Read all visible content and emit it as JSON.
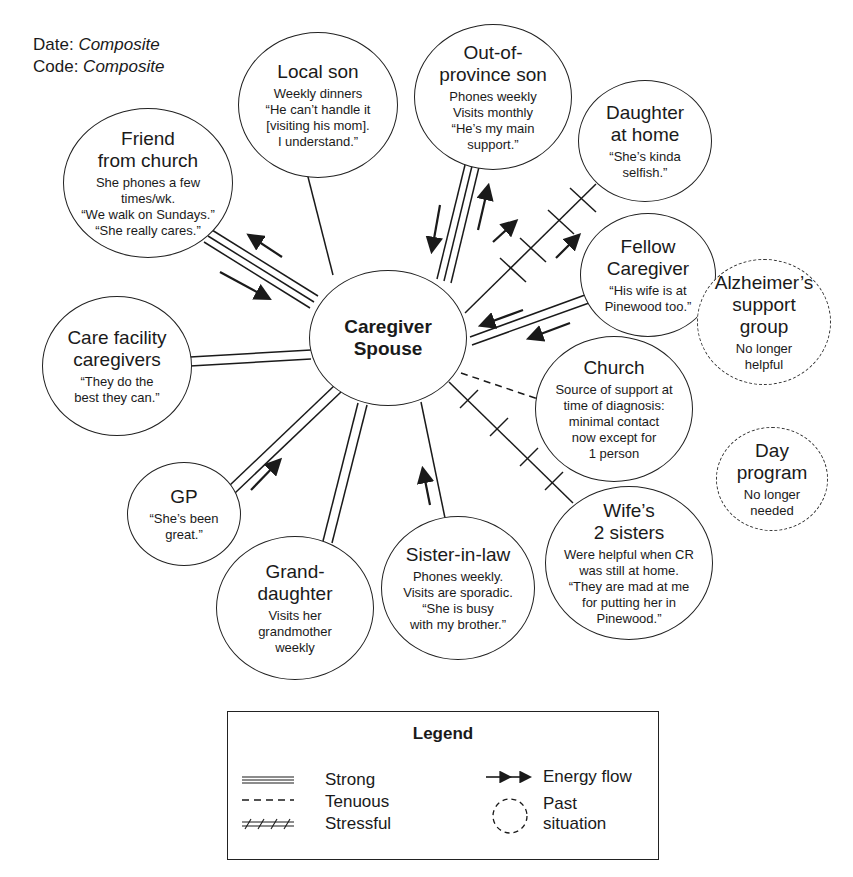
{
  "header": {
    "date_label": "Date:",
    "date_value": "Composite",
    "code_label": "Code:",
    "code_value": "Composite"
  },
  "center": {
    "title": "Caregiver\nSpouse"
  },
  "nodes": [
    {
      "id": "local-son",
      "title": "Local son",
      "desc": "Weekly dinners\n“He can’t handle it\n[visiting his mom].\nI understand.”",
      "tie": "normal",
      "energy": "none"
    },
    {
      "id": "out-of-province-son",
      "title": "Out-of-\nprovince son",
      "desc": "Phones weekly\nVisits monthly\n“He’s my main\nsupport.”",
      "tie": "strong",
      "energy": "both"
    },
    {
      "id": "daughter-at-home",
      "title": "Daughter\nat home",
      "desc": "“She’s kinda\nselfish.”",
      "tie": "stressful",
      "energy": "to-node"
    },
    {
      "id": "fellow-caregiver",
      "title": "Fellow\nCaregiver",
      "desc": "“His wife is at\nPinewood too.”",
      "tie": "strong",
      "energy": "to-center"
    },
    {
      "id": "friend-from-church",
      "title": "Friend\nfrom church",
      "desc": "She phones a few\ntimes/wk.\n“We walk on Sundays.”\n“She really cares.”",
      "tie": "strong",
      "energy": "both"
    },
    {
      "id": "care-facility-caregivers",
      "title": "Care facility\ncaregivers",
      "desc": "“They do the\nbest they can.”",
      "tie": "strong",
      "energy": "none"
    },
    {
      "id": "church",
      "title": "Church",
      "desc": "Source of support at\ntime of diagnosis:\nminimal contact\nnow except for\n1 person",
      "tie": "tenuous",
      "energy": "none"
    },
    {
      "id": "gp",
      "title": "GP",
      "desc": "“She’s been\ngreat.”",
      "tie": "strong",
      "energy": "to-center"
    },
    {
      "id": "granddaughter",
      "title": "Grand-\ndaughter",
      "desc": "Visits her\ngrandmother\nweekly",
      "tie": "strong",
      "energy": "none"
    },
    {
      "id": "sister-in-law",
      "title": "Sister-in-law",
      "desc": "Phones weekly.\nVisits are sporadic.\n“She is busy\nwith my brother.”",
      "tie": "normal",
      "energy": "to-center"
    },
    {
      "id": "wifes-2-sisters",
      "title": "Wife’s\n2 sisters",
      "desc": "Were helpful when CR\nwas still at home.\n“They are mad at me\nfor putting her in\nPinewood.”",
      "tie": "stressful",
      "energy": "none"
    }
  ],
  "past_nodes": [
    {
      "id": "alzheimers-support-group",
      "title": "Alzheimer’s\nsupport\ngroup",
      "desc": "No longer\nhelpful"
    },
    {
      "id": "day-program",
      "title": "Day\nprogram",
      "desc": "No longer\nneeded"
    }
  ],
  "legend": {
    "title": "Legend",
    "items": [
      {
        "symbol": "strong-line",
        "label": "Strong"
      },
      {
        "symbol": "dashed-line",
        "label": "Tenuous"
      },
      {
        "symbol": "crossed-line",
        "label": "Stressful"
      },
      {
        "symbol": "arrows",
        "label": "Energy flow"
      },
      {
        "symbol": "dashed-circle",
        "label": "Past\nsituation"
      }
    ]
  },
  "colors": {
    "ink": "#1a1a1a",
    "background": "#ffffff"
  }
}
